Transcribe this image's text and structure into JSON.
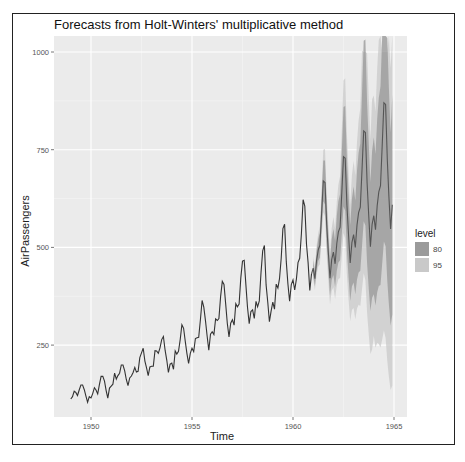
{
  "chart_data": {
    "type": "line",
    "title": "Forecasts from Holt-Winters' multiplicative method",
    "xlabel": "Time",
    "ylabel": "AirPassengers",
    "xlim": [
      1948.7,
      1965.6
    ],
    "ylim": [
      80,
      1040
    ],
    "x_ticks": [
      1950,
      1955,
      1960,
      1965
    ],
    "y_ticks": [
      250,
      500,
      750,
      1000
    ],
    "grid": true,
    "legend": {
      "title": "level",
      "position": "right",
      "entries": [
        {
          "label": "80",
          "color": "#9b9b9b"
        },
        {
          "label": "95",
          "color": "#c9c9c9"
        }
      ]
    },
    "observed": {
      "start": 1949,
      "frequency": 12,
      "values": [
        112,
        118,
        132,
        129,
        121,
        135,
        148,
        148,
        136,
        119,
        104,
        118,
        115,
        126,
        141,
        135,
        125,
        149,
        170,
        170,
        158,
        133,
        114,
        140,
        145,
        150,
        178,
        163,
        172,
        178,
        199,
        199,
        184,
        162,
        146,
        166,
        171,
        180,
        193,
        181,
        183,
        218,
        230,
        242,
        209,
        191,
        172,
        194,
        196,
        196,
        236,
        235,
        229,
        243,
        264,
        272,
        237,
        211,
        180,
        201,
        204,
        188,
        235,
        227,
        234,
        264,
        302,
        293,
        259,
        229,
        203,
        229,
        242,
        233,
        267,
        269,
        270,
        315,
        364,
        347,
        312,
        274,
        237,
        278,
        284,
        277,
        317,
        313,
        318,
        374,
        413,
        405,
        355,
        306,
        271,
        306,
        315,
        301,
        356,
        348,
        355,
        422,
        465,
        467,
        404,
        347,
        305,
        336,
        340,
        318,
        362,
        348,
        363,
        435,
        491,
        505,
        404,
        359,
        310,
        337,
        360,
        342,
        406,
        396,
        420,
        472,
        548,
        559,
        463,
        407,
        362,
        405,
        417,
        391,
        419,
        461,
        472,
        535,
        622,
        606,
        508,
        461,
        390,
        432
      ]
    },
    "forecast": {
      "start": 1961,
      "frequency": 12,
      "mean": [
        447,
        420,
        467,
        494,
        506,
        586,
        670,
        666,
        558,
        485,
        421,
        469,
        488,
        458,
        510,
        540,
        552,
        640,
        732,
        728,
        609,
        530,
        460,
        512,
        533,
        500,
        557,
        589,
        603,
        698,
        798,
        794,
        665,
        578,
        502,
        559,
        581,
        545,
        607,
        642,
        658,
        761,
        870,
        866,
        725,
        630,
        547,
        609
      ],
      "lo80": [
        428,
        401,
        443,
        466,
        474,
        545,
        618,
        610,
        507,
        438,
        377,
        417,
        429,
        399,
        440,
        461,
        467,
        535,
        605,
        594,
        491,
        423,
        363,
        400,
        410,
        380,
        418,
        436,
        440,
        503,
        567,
        556,
        459,
        393,
        337,
        371,
        380,
        351,
        385,
        401,
        404,
        459,
        515,
        503,
        414,
        353,
        300,
        328
      ],
      "hi80": [
        466,
        439,
        491,
        522,
        538,
        627,
        722,
        722,
        609,
        532,
        465,
        521,
        547,
        517,
        580,
        619,
        637,
        745,
        859,
        862,
        727,
        637,
        557,
        624,
        656,
        620,
        696,
        742,
        766,
        893,
        1029,
        1032,
        871,
        763,
        667,
        747,
        782,
        739,
        829,
        883,
        912,
        1063,
        1225,
        1229,
        1036,
        907,
        794,
        890
      ],
      "lo95": [
        418,
        391,
        430,
        451,
        457,
        523,
        590,
        580,
        480,
        413,
        354,
        389,
        398,
        368,
        403,
        419,
        422,
        479,
        537,
        523,
        429,
        366,
        311,
        340,
        345,
        316,
        344,
        353,
        350,
        393,
        434,
        416,
        333,
        276,
        227,
        239,
        273,
        243,
        256,
        253,
        244,
        264,
        287,
        268,
        209,
        168,
        135,
        147
      ],
      "hi95": [
        476,
        449,
        504,
        537,
        555,
        649,
        750,
        752,
        636,
        557,
        488,
        549,
        578,
        548,
        617,
        661,
        682,
        801,
        927,
        933,
        789,
        694,
        609,
        684,
        721,
        684,
        770,
        825,
        856,
        1003,
        1000,
        1000,
        997,
        880,
        777,
        879,
        889,
        847,
        958,
        1031,
        1072,
        1000,
        1000,
        1000,
        1000,
        1092,
        959,
        1071
      ]
    },
    "colors": {
      "panel_bg": "#ebebeb",
      "grid_major": "#ffffff",
      "line": "#333333",
      "forecast_line": "#555555",
      "band80": "#9b9b9b",
      "band95": "#c9c9c9"
    }
  }
}
